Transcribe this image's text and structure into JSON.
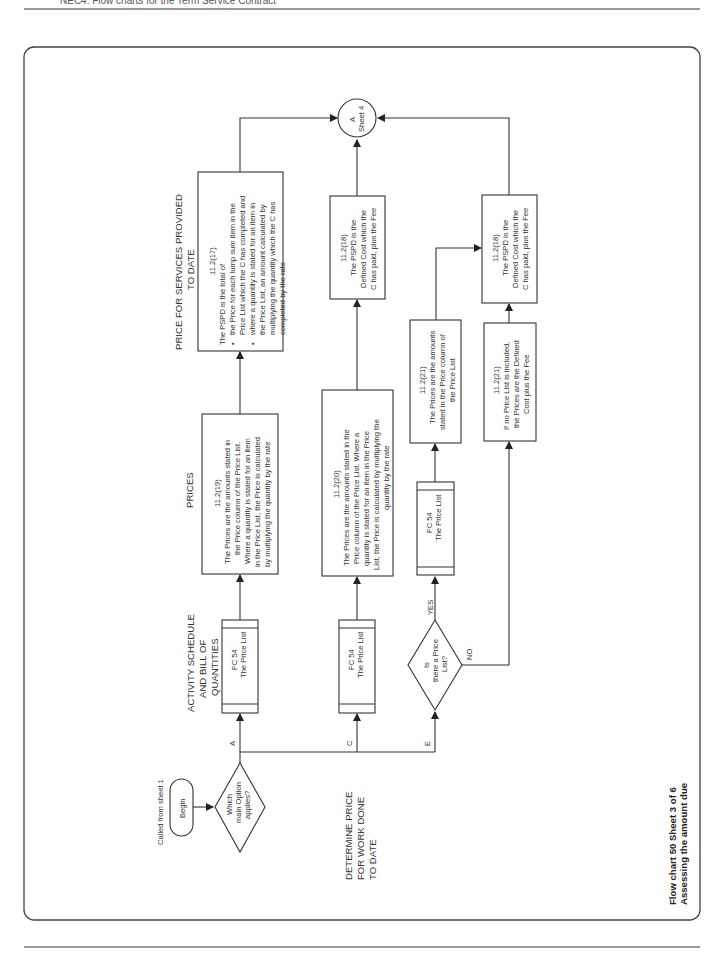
{
  "page": {
    "header_text": "NEC4: Flow charts for the Term Service Contract",
    "footer_caption_line1": "Flow chart 50  Sheet 3 of 6",
    "footer_caption_line2": "Assessing the amount due"
  },
  "flowchart": {
    "orientation": "rotated 90° counter-clockwise (reads bottom-to-top)",
    "start": {
      "note": "Called from sheet 1",
      "terminator": "Begin"
    },
    "decision_main": {
      "line1": "Which",
      "line2": "main Option",
      "line3": "applies?"
    },
    "branch_labels": {
      "a": "A",
      "c": "C",
      "e": "E"
    },
    "section_labels": {
      "activity_schedule": [
        "ACTIVITY SCHEDULE",
        "AND BILL OF",
        "QUANTITIES"
      ],
      "prices": "PRICES",
      "pspd": [
        "PRICE FOR SERVICES PROVIDED",
        "TO DATE"
      ],
      "determine": [
        "DETERMINE PRICE",
        "FOR WORK DONE",
        "TO DATE"
      ]
    },
    "fc54_box": {
      "line1": "FC 54",
      "line2": "The Price List"
    },
    "box_11_2_19": {
      "ref": "11.2(19)",
      "lines": [
        "The Prices are the amounts stated in",
        "the Price column of the Price List.",
        "Where a quantity is stated for an item",
        "in the Price List, the Price is calculated",
        "by multiplying the quantity by the rate"
      ]
    },
    "box_11_2_17": {
      "ref": "11.2(17)",
      "intro": "The PSPD is the total of",
      "bullet1": [
        "the Price for each lump sum item in the",
        "Price List which the C has completed and"
      ],
      "bullet2": [
        "where a quantity is stated for an item in",
        "the Price List, an amount calculated by",
        "multiplying the quantity which the C has",
        "completed by the rate"
      ]
    },
    "box_11_2_20": {
      "ref": "11.2(20)",
      "lines": [
        "The Prices are the amounts stated in the",
        "Price column of the Price List. Where a",
        "quantity is stated for an item in the Price",
        "List, the Price is calculated by multiplying the",
        "quantity by the rate"
      ]
    },
    "box_11_2_18": {
      "ref": "11.2(18)",
      "lines": [
        "The PSPD is the",
        "Defined Cost which the",
        "C has paid, plus the Fee"
      ]
    },
    "decision_price_list": {
      "line1": "Is",
      "line2": "there a Price",
      "line3": "List?",
      "yes": "YES",
      "no": "NO"
    },
    "box_11_2_21_yes": {
      "ref": "11.2(21)",
      "lines": [
        "The Prices are the amounts",
        "stated in the Price column of",
        "the Price List"
      ]
    },
    "box_11_2_21_no": {
      "ref": "11.2(21)",
      "lines": [
        "If no Price List is included,",
        "the Prices are the Defined",
        "Cost plus the Fee"
      ]
    },
    "connector": {
      "line1": "A",
      "line2": "Sheet 4"
    }
  }
}
